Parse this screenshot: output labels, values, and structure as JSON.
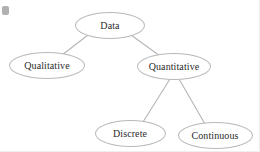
{
  "diagram": {
    "title": "Data",
    "type": "tree",
    "background_color": "#ffffff",
    "node_stroke_color": "#b9b9b9",
    "node_fill_color": "#ffffff",
    "edge_color": "#b5b5b5",
    "text_color": "#2b2b2b",
    "marker_color": "#b0b0b0",
    "nodes": [
      {
        "id": "data",
        "label": "Data",
        "cx": 110,
        "cy": 25,
        "rx": 35,
        "ry": 13.5,
        "level": 0
      },
      {
        "id": "qualitative",
        "label": "Qualitative",
        "cx": 47,
        "cy": 65,
        "rx": 38,
        "ry": 13.5,
        "level": 1
      },
      {
        "id": "quantitative",
        "label": "Quantitative",
        "cx": 174,
        "cy": 66,
        "rx": 37,
        "ry": 13.5,
        "level": 1
      },
      {
        "id": "discrete",
        "label": "Discrete",
        "cx": 130,
        "cy": 133,
        "rx": 35.5,
        "ry": 13.5,
        "level": 2
      },
      {
        "id": "continuous",
        "label": "Continuous",
        "cx": 215,
        "cy": 135,
        "rx": 37.5,
        "ry": 13.5,
        "level": 2
      }
    ],
    "edges": [
      {
        "id": "data-qualitative",
        "from": "data",
        "to": "qualitative",
        "x1": 88,
        "y1": 35,
        "x2": 62,
        "y2": 55
      },
      {
        "id": "data-quantitative",
        "from": "data",
        "to": "quantitative",
        "x1": 131,
        "y1": 35,
        "x2": 160,
        "y2": 56
      },
      {
        "id": "quantitative-discrete",
        "from": "quantitative",
        "to": "discrete",
        "x1": 170,
        "y1": 79,
        "x2": 143,
        "y2": 122
      },
      {
        "id": "quantitative-continuous",
        "from": "quantitative",
        "to": "continuous",
        "x1": 179,
        "y1": 79,
        "x2": 205,
        "y2": 124
      }
    ],
    "marker": {
      "name": "corner-dot",
      "x": 2,
      "y": 6,
      "width": 7,
      "height": 9
    }
  }
}
